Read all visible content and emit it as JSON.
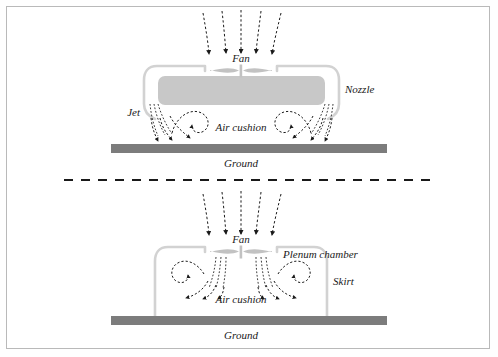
{
  "figure": {
    "type": "technical-diagram",
    "panel_count": 2,
    "divider": "dashed-horizontal-line",
    "colors": {
      "craft_body_fill": "#c8c8c8",
      "duct_outline": "#d2d2d2",
      "fan_fill": "#c2c2c2",
      "ground_fill": "#7c7c7c",
      "flow_line": "#1a1a1a",
      "frame_border": "#b9b9b9",
      "background": "#ffffff"
    }
  },
  "panels": [
    {
      "id": "peripheral-jet",
      "name": "Peripheral jet / nozzle hovercraft",
      "labels": {
        "fan": "Fan",
        "nozzle": "Nozzle",
        "jet": "Jet",
        "air_cushion": "Air cushion",
        "ground": "Ground"
      },
      "flow": {
        "intake_arrows": 5,
        "vortices": 2,
        "jet_streams_per_side": 3,
        "exit_arrows_per_side": 3
      }
    },
    {
      "id": "plenum-chamber",
      "name": "Plenum chamber hovercraft",
      "labels": {
        "fan": "Fan",
        "plenum_chamber": "Plenum chamber",
        "skirt": "Skirt",
        "air_cushion": "Air cushion",
        "ground": "Ground"
      },
      "flow": {
        "intake_arrows": 5,
        "vortices": 2,
        "jet_streams_per_side": 3,
        "exit_arrows_per_side": 3
      }
    }
  ]
}
